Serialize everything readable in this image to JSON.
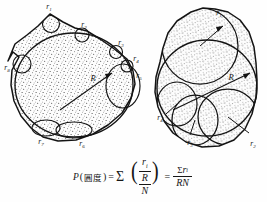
{
  "figure": {
    "colors": {
      "background": "#ffffff",
      "outline": "#141414",
      "stipple": "#2b2b2b",
      "fill": "#fdfdfd",
      "label": "#161616"
    },
    "grain_left": {
      "name": "angular-grain",
      "center_label": "R",
      "corner_labels": [
        {
          "id": "r1",
          "text": "r",
          "subscript": "1",
          "x": 49,
          "y": 9
        },
        {
          "id": "r2",
          "text": "r",
          "subscript": "2",
          "x": 84,
          "y": 27
        },
        {
          "id": "r3",
          "text": "r",
          "subscript": "3",
          "x": 120,
          "y": 44
        },
        {
          "id": "r4",
          "text": "r",
          "subscript": "4",
          "x": 134,
          "y": 59
        },
        {
          "id": "r5",
          "text": "r",
          "subscript": "5",
          "x": 137,
          "y": 75
        },
        {
          "id": "r6",
          "text": "r",
          "subscript": "6",
          "x": 81,
          "y": 140
        },
        {
          "id": "r7",
          "text": "r",
          "subscript": "7",
          "x": 41,
          "y": 139
        },
        {
          "id": "r8",
          "text": "r",
          "subscript": "8",
          "x": 7,
          "y": 66
        }
      ]
    },
    "grain_right": {
      "name": "rounded-grain",
      "center_label": "R",
      "corner_labels": [
        {
          "id": "r1",
          "text": "r",
          "subscript": "1",
          "x": 219,
          "y": 12
        },
        {
          "id": "r2",
          "text": "r",
          "subscript": "2",
          "x": 251,
          "y": 142
        },
        {
          "id": "r3",
          "text": "r",
          "subscript": "3",
          "x": 190,
          "y": 139
        },
        {
          "id": "r4",
          "text": "r",
          "subscript": "4",
          "x": 161,
          "y": 116
        }
      ]
    },
    "formula": {
      "lhs_symbol": "P",
      "lhs_open": "(",
      "lhs_cjk": "圓度",
      "lhs_close": ")",
      "equals": "=",
      "sigma": "Σ",
      "numerator_r": "r",
      "numerator_sub": "i",
      "numerator_R": "R",
      "denominator": "N",
      "equals2": "=",
      "rhs_sigma": "Σ",
      "rhs_r": "r",
      "rhs_sub": "i",
      "rhs_denominator": "RN",
      "plain_text": "P(圓度) = Σ ( r_i / R ) / N = Σr_i / RN"
    }
  }
}
